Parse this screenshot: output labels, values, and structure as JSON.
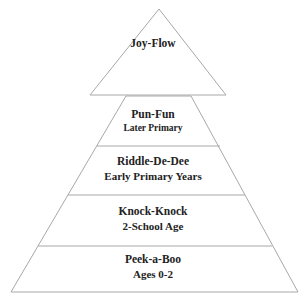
{
  "diagram": {
    "type": "pyramid",
    "line_color": "#a8a8a8",
    "text_color": "#222222",
    "apex": {
      "label": "Joy-Flow"
    },
    "levels": [
      {
        "title": "Pun-Fun",
        "subtitle": "Later Primary"
      },
      {
        "title": "Riddle-De-Dee",
        "subtitle": "Early Primary Years"
      },
      {
        "title": "Knock-Knock",
        "subtitle": "2-School Age"
      },
      {
        "title": "Peek-a-Boo",
        "subtitle": "Ages 0-2"
      }
    ]
  }
}
